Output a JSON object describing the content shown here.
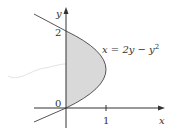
{
  "figure": {
    "equation": "x = 2y − y",
    "equation_exponent": "2",
    "axis_x_label": "x",
    "axis_y_label": "y",
    "tick_y_top": "2",
    "tick_origin": "0",
    "tick_x_one": "1"
  },
  "colors": {
    "fill": "#d9d9d9",
    "curve": "#555555",
    "axis": "#333333"
  }
}
